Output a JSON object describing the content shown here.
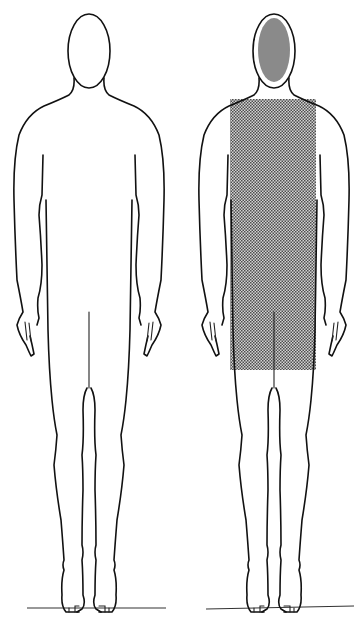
{
  "diagram": {
    "type": "body-outline-figures",
    "figures": [
      {
        "id": "figure-left",
        "label": "",
        "shaded_regions": []
      },
      {
        "id": "figure-right",
        "label": "",
        "shaded_regions": [
          {
            "name": "head",
            "style": "solid-gray"
          },
          {
            "name": "torso-to-upper-thighs",
            "style": "dotted-halftone"
          }
        ]
      }
    ],
    "colors": {
      "outline": "#111111",
      "head_fill": "#8a8a8a",
      "torso_pattern_dark": "#5a5a5a",
      "torso_pattern_light": "#d8d8d8",
      "background": "#ffffff"
    }
  }
}
